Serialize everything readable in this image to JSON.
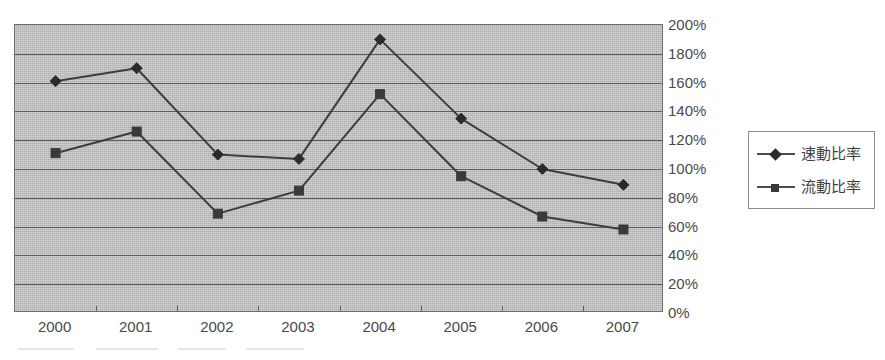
{
  "chart_data": {
    "type": "line",
    "title": "",
    "subtitle": "",
    "xlabel": "",
    "ylabel": "",
    "categories": [
      "2000",
      "2001",
      "2002",
      "2003",
      "2004",
      "2005",
      "2006",
      "2007"
    ],
    "series": [
      {
        "name": "速動比率",
        "marker": "diamond",
        "color": "#2b2b2b",
        "values": [
          161,
          170,
          110,
          107,
          190,
          135,
          100,
          89
        ]
      },
      {
        "name": "流動比率",
        "marker": "square",
        "color": "#3a3a3a",
        "values": [
          111,
          126,
          69,
          85,
          152,
          95,
          67,
          58
        ]
      }
    ],
    "ylim": [
      0,
      200
    ],
    "ytick_step": 20,
    "ytick_labels": [
      "200%",
      "180%",
      "160%",
      "140%",
      "120%",
      "100%",
      "80%",
      "60%",
      "40%",
      "20%",
      "0%"
    ],
    "ytick_values": [
      200,
      180,
      160,
      140,
      120,
      100,
      80,
      60,
      40,
      20,
      0
    ],
    "yaxis_position": "right",
    "grid": true,
    "grid_axis": "horizontal",
    "legend_position": "right",
    "plot_background": "#bdbdbd",
    "line_color": "#3d3d3d"
  },
  "legend": {
    "items": [
      {
        "label": "速動比率",
        "marker": "diamond"
      },
      {
        "label": "流動比率",
        "marker": "square"
      }
    ]
  }
}
